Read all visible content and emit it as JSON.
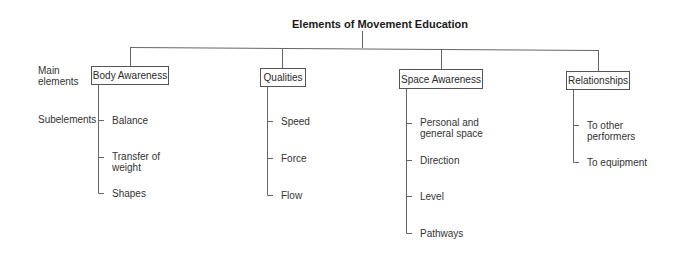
{
  "diagram": {
    "title": "Elements of Movement Education",
    "row_labels": {
      "main_line1": "Main",
      "main_line2": "elements",
      "sub": "Subelements"
    },
    "main_elements": [
      {
        "label": "Body Awareness",
        "subelements": [
          {
            "line1": "Balance",
            "line2": ""
          },
          {
            "line1": "Transfer of",
            "line2": "weight"
          },
          {
            "line1": "Shapes",
            "line2": ""
          }
        ]
      },
      {
        "label": "Qualities",
        "subelements": [
          {
            "line1": "Speed",
            "line2": ""
          },
          {
            "line1": "Force",
            "line2": ""
          },
          {
            "line1": "Flow",
            "line2": ""
          }
        ]
      },
      {
        "label": "Space Awareness",
        "subelements": [
          {
            "line1": "Personal and",
            "line2": "general space"
          },
          {
            "line1": "Direction",
            "line2": ""
          },
          {
            "line1": "Level",
            "line2": ""
          },
          {
            "line1": "Pathways",
            "line2": ""
          }
        ]
      },
      {
        "label": "Relationships",
        "subelements": [
          {
            "line1": "To other",
            "line2": "performers"
          },
          {
            "line1": "To equipment",
            "line2": ""
          }
        ]
      }
    ],
    "line_color": "#666666"
  }
}
